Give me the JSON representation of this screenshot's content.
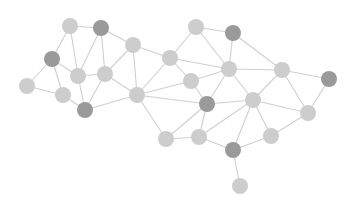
{
  "diagram": {
    "type": "network-graph",
    "width": 354,
    "height": 207,
    "colors": {
      "background": "#ffffff",
      "edge": "#cfcfcf",
      "node_light": "#cdcdcd",
      "node_dark": "#9a9a9a"
    },
    "node_radius": 8,
    "nodes": [
      {
        "id": "n1",
        "x": 70,
        "y": 26,
        "tone": "light"
      },
      {
        "id": "n2",
        "x": 101,
        "y": 28,
        "tone": "dark"
      },
      {
        "id": "n3",
        "x": 52,
        "y": 59,
        "tone": "dark"
      },
      {
        "id": "n4",
        "x": 78,
        "y": 76,
        "tone": "light"
      },
      {
        "id": "n5",
        "x": 105,
        "y": 74,
        "tone": "light"
      },
      {
        "id": "n6",
        "x": 27,
        "y": 86,
        "tone": "light"
      },
      {
        "id": "n7",
        "x": 63,
        "y": 95,
        "tone": "light"
      },
      {
        "id": "n8",
        "x": 85,
        "y": 110,
        "tone": "dark"
      },
      {
        "id": "n9",
        "x": 133,
        "y": 45,
        "tone": "light"
      },
      {
        "id": "n10",
        "x": 137,
        "y": 95,
        "tone": "light"
      },
      {
        "id": "n11",
        "x": 170,
        "y": 58,
        "tone": "light"
      },
      {
        "id": "n12",
        "x": 196,
        "y": 27,
        "tone": "light"
      },
      {
        "id": "n13",
        "x": 233,
        "y": 33,
        "tone": "dark"
      },
      {
        "id": "n14",
        "x": 191,
        "y": 81,
        "tone": "light"
      },
      {
        "id": "n15",
        "x": 229,
        "y": 69,
        "tone": "light"
      },
      {
        "id": "n16",
        "x": 207,
        "y": 104,
        "tone": "dark"
      },
      {
        "id": "n17",
        "x": 282,
        "y": 70,
        "tone": "light"
      },
      {
        "id": "n18",
        "x": 329,
        "y": 79,
        "tone": "dark"
      },
      {
        "id": "n19",
        "x": 253,
        "y": 100,
        "tone": "light"
      },
      {
        "id": "n20",
        "x": 308,
        "y": 113,
        "tone": "light"
      },
      {
        "id": "n21",
        "x": 271,
        "y": 136,
        "tone": "light"
      },
      {
        "id": "n22",
        "x": 166,
        "y": 139,
        "tone": "light"
      },
      {
        "id": "n23",
        "x": 199,
        "y": 137,
        "tone": "light"
      },
      {
        "id": "n24",
        "x": 233,
        "y": 150,
        "tone": "dark"
      },
      {
        "id": "n25",
        "x": 240,
        "y": 186,
        "tone": "light"
      }
    ],
    "edges": [
      [
        "n1",
        "n2"
      ],
      [
        "n1",
        "n3"
      ],
      [
        "n1",
        "n4"
      ],
      [
        "n2",
        "n9"
      ],
      [
        "n2",
        "n5"
      ],
      [
        "n2",
        "n4"
      ],
      [
        "n3",
        "n4"
      ],
      [
        "n3",
        "n6"
      ],
      [
        "n3",
        "n7"
      ],
      [
        "n6",
        "n7"
      ],
      [
        "n4",
        "n5"
      ],
      [
        "n4",
        "n8"
      ],
      [
        "n7",
        "n8"
      ],
      [
        "n5",
        "n8"
      ],
      [
        "n5",
        "n10"
      ],
      [
        "n5",
        "n9"
      ],
      [
        "n8",
        "n10"
      ],
      [
        "n9",
        "n10"
      ],
      [
        "n9",
        "n11"
      ],
      [
        "n10",
        "n11"
      ],
      [
        "n10",
        "n14"
      ],
      [
        "n10",
        "n16"
      ],
      [
        "n10",
        "n22"
      ],
      [
        "n11",
        "n12"
      ],
      [
        "n11",
        "n15"
      ],
      [
        "n11",
        "n14"
      ],
      [
        "n12",
        "n13"
      ],
      [
        "n12",
        "n15"
      ],
      [
        "n13",
        "n15"
      ],
      [
        "n13",
        "n17"
      ],
      [
        "n14",
        "n15"
      ],
      [
        "n14",
        "n16"
      ],
      [
        "n15",
        "n17"
      ],
      [
        "n15",
        "n16"
      ],
      [
        "n15",
        "n19"
      ],
      [
        "n16",
        "n19"
      ],
      [
        "n16",
        "n22"
      ],
      [
        "n16",
        "n23"
      ],
      [
        "n17",
        "n18"
      ],
      [
        "n17",
        "n19"
      ],
      [
        "n17",
        "n20"
      ],
      [
        "n18",
        "n20"
      ],
      [
        "n19",
        "n20"
      ],
      [
        "n19",
        "n21"
      ],
      [
        "n19",
        "n24"
      ],
      [
        "n19",
        "n23"
      ],
      [
        "n20",
        "n21"
      ],
      [
        "n21",
        "n24"
      ],
      [
        "n22",
        "n23"
      ],
      [
        "n23",
        "n24"
      ],
      [
        "n24",
        "n25"
      ]
    ]
  }
}
